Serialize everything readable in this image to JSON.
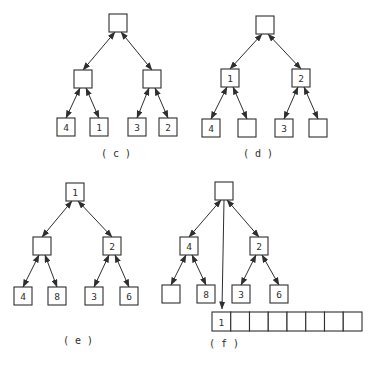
{
  "figure": {
    "ink_color": "#2e2e2e",
    "background_color": "#ffffff",
    "node_size": 18,
    "panels": [
      {
        "id": "c",
        "label": "( c )",
        "label_x": 116,
        "label_y": 157,
        "nodes": [
          {
            "id": "root",
            "label": "",
            "x": 118,
            "y": 23
          },
          {
            "id": "l",
            "label": "",
            "x": 83,
            "y": 79
          },
          {
            "id": "r",
            "label": "",
            "x": 152,
            "y": 79
          },
          {
            "id": "ll",
            "label": "4",
            "x": 66,
            "y": 127
          },
          {
            "id": "lr",
            "label": "1",
            "x": 99,
            "y": 127
          },
          {
            "id": "rl",
            "label": "3",
            "x": 137,
            "y": 127
          },
          {
            "id": "rr",
            "label": "2",
            "x": 168,
            "y": 127
          }
        ],
        "edges": [
          [
            "root",
            "l"
          ],
          [
            "root",
            "r"
          ],
          [
            "l",
            "ll"
          ],
          [
            "l",
            "lr"
          ],
          [
            "r",
            "rl"
          ],
          [
            "r",
            "rr"
          ]
        ]
      },
      {
        "id": "d",
        "label": "( d )",
        "label_x": 258,
        "label_y": 157,
        "nodes": [
          {
            "id": "root",
            "label": "",
            "x": 265,
            "y": 25
          },
          {
            "id": "l",
            "label": "1",
            "x": 230,
            "y": 78
          },
          {
            "id": "r",
            "label": "2",
            "x": 301,
            "y": 78
          },
          {
            "id": "ll",
            "label": "4",
            "x": 211,
            "y": 128
          },
          {
            "id": "lr",
            "label": "",
            "x": 247,
            "y": 128
          },
          {
            "id": "rl",
            "label": "3",
            "x": 284,
            "y": 128
          },
          {
            "id": "rr",
            "label": "",
            "x": 318,
            "y": 128
          }
        ],
        "edges": [
          [
            "root",
            "l"
          ],
          [
            "root",
            "r"
          ],
          [
            "l",
            "ll"
          ],
          [
            "l",
            "lr"
          ],
          [
            "r",
            "rl"
          ],
          [
            "r",
            "rr"
          ]
        ]
      },
      {
        "id": "e",
        "label": "( e )",
        "label_x": 78,
        "label_y": 344,
        "nodes": [
          {
            "id": "root",
            "label": "1",
            "x": 75,
            "y": 192
          },
          {
            "id": "l",
            "label": "",
            "x": 42,
            "y": 246
          },
          {
            "id": "r",
            "label": "2",
            "x": 112,
            "y": 246
          },
          {
            "id": "ll",
            "label": "4",
            "x": 23,
            "y": 296
          },
          {
            "id": "lr",
            "label": "8",
            "x": 57,
            "y": 296
          },
          {
            "id": "rl",
            "label": "3",
            "x": 94,
            "y": 296
          },
          {
            "id": "rr",
            "label": "6",
            "x": 129,
            "y": 296
          }
        ],
        "edges": [
          [
            "root",
            "l"
          ],
          [
            "root",
            "r"
          ],
          [
            "l",
            "ll"
          ],
          [
            "l",
            "lr"
          ],
          [
            "r",
            "rl"
          ],
          [
            "r",
            "rr"
          ]
        ]
      },
      {
        "id": "f",
        "label": "( f )",
        "label_x": 224,
        "label_y": 347,
        "nodes": [
          {
            "id": "root",
            "label": "",
            "x": 224,
            "y": 191
          },
          {
            "id": "l",
            "label": "4",
            "x": 189,
            "y": 246
          },
          {
            "id": "r",
            "label": "2",
            "x": 259,
            "y": 246
          },
          {
            "id": "ll",
            "label": "",
            "x": 171,
            "y": 294
          },
          {
            "id": "lr",
            "label": "8",
            "x": 206,
            "y": 294
          },
          {
            "id": "rl",
            "label": "3",
            "x": 241,
            "y": 294
          },
          {
            "id": "rr",
            "label": "6",
            "x": 279,
            "y": 294
          }
        ],
        "edges": [
          [
            "root",
            "l"
          ],
          [
            "root",
            "r"
          ],
          [
            "l",
            "ll"
          ],
          [
            "l",
            "lr"
          ],
          [
            "r",
            "rl"
          ],
          [
            "r",
            "rr"
          ]
        ],
        "extra_arrow": {
          "x1": 224,
          "y1": 200,
          "x2": 222,
          "y2": 309
        },
        "array": {
          "x": 212,
          "y": 312,
          "cell_width": 18.75,
          "cell_height": 19,
          "cells": [
            "1",
            "",
            "",
            "",
            "",
            "",
            "",
            ""
          ]
        }
      }
    ]
  }
}
